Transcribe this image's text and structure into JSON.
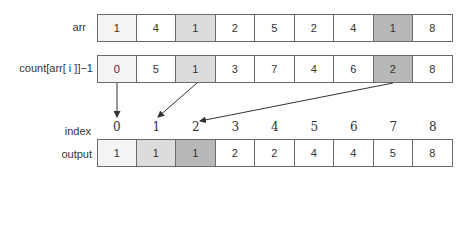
{
  "rows": {
    "arr": {
      "label": "arr",
      "values": [
        "1",
        "4",
        "1",
        "2",
        "5",
        "2",
        "4",
        "1",
        "8"
      ],
      "shades": [
        "#f4f4f4",
        "#ffffff",
        "#dcdcdc",
        "#ffffff",
        "#ffffff",
        "#ffffff",
        "#ffffff",
        "#b8b8b8",
        "#ffffff"
      ]
    },
    "count": {
      "label": "count[arr[ i ]]−1",
      "values": [
        "0",
        "5",
        "1",
        "3",
        "7",
        "4",
        "6",
        "2",
        "8"
      ],
      "shades": [
        "#f4f4f4",
        "#ffffff",
        "#dcdcdc",
        "#ffffff",
        "#ffffff",
        "#ffffff",
        "#ffffff",
        "#b8b8b8",
        "#ffffff"
      ]
    },
    "index": {
      "label": "index",
      "values": [
        "0",
        "1",
        "2",
        "3",
        "4",
        "5",
        "6",
        "7",
        "8"
      ]
    },
    "output": {
      "label": "output",
      "values": [
        "1",
        "1",
        "1",
        "2",
        "2",
        "4",
        "4",
        "5",
        "8"
      ],
      "shades": [
        "#f4f4f4",
        "#dcdcdc",
        "#b8b8b8",
        "#ffffff",
        "#ffffff",
        "#ffffff",
        "#ffffff",
        "#ffffff",
        "#ffffff"
      ]
    }
  },
  "arrows": [
    {
      "from_count_index": 0,
      "to_output_index": 0
    },
    {
      "from_count_index": 2,
      "to_output_index": 1
    },
    {
      "from_count_index": 7,
      "to_output_index": 2
    }
  ]
}
